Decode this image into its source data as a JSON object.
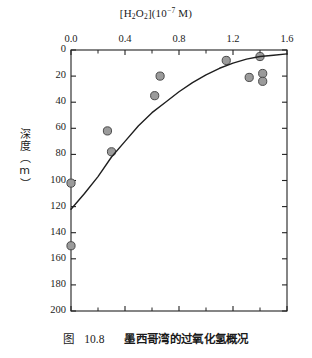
{
  "figure": {
    "caption_label": "图",
    "caption_number": "10.8",
    "caption_text": "墨西哥湾的过氧化氢概况"
  },
  "chart_data": {
    "type": "scatter",
    "title": "",
    "xlabel": "[H2O2](10-7 M)",
    "xlabel_parts": {
      "prefix": "[H",
      "sub1": "2",
      "mid": "O",
      "sub2": "2",
      "suffix": "](10",
      "exp": "−7",
      "tail": " M)"
    },
    "ylabel": "深度（m）",
    "xlim": [
      0.0,
      1.6
    ],
    "ylim": [
      0,
      200
    ],
    "y_inverted": true,
    "grid": false,
    "legend": "none",
    "x_axis_position": "top",
    "xticks": [
      0.0,
      0.4,
      0.8,
      1.2,
      1.6
    ],
    "xticklabels": [
      "0.0",
      "0.4",
      "0.8",
      "1.2",
      "1.6"
    ],
    "x_minor_ticks": [
      0.2,
      0.6,
      1.0,
      1.4
    ],
    "yticks": [
      0,
      20,
      40,
      60,
      80,
      100,
      120,
      140,
      160,
      180,
      200
    ],
    "yticklabels": [
      "0",
      "20",
      "40",
      "60",
      "80",
      "100",
      "120",
      "140",
      "160",
      "180",
      "200"
    ],
    "series": [
      {
        "name": "H2O2 profile measurements",
        "type": "scatter",
        "marker": "circle",
        "marker_color": "#9b9b9b",
        "marker_edge_color": "#4a4a4a",
        "points": [
          {
            "x": 0.0,
            "y": 102
          },
          {
            "x": 0.0,
            "y": 150
          },
          {
            "x": 0.27,
            "y": 62
          },
          {
            "x": 0.3,
            "y": 78
          },
          {
            "x": 0.62,
            "y": 35
          },
          {
            "x": 0.66,
            "y": 20
          },
          {
            "x": 1.15,
            "y": 8
          },
          {
            "x": 1.32,
            "y": 21
          },
          {
            "x": 1.4,
            "y": 5
          },
          {
            "x": 1.42,
            "y": 18
          },
          {
            "x": 1.42,
            "y": 24
          }
        ]
      },
      {
        "name": "fitted profile curve",
        "type": "line",
        "line_color": "#1f1f1f",
        "points": [
          {
            "x": 0.0,
            "y": 122
          },
          {
            "x": 0.1,
            "y": 110
          },
          {
            "x": 0.2,
            "y": 97
          },
          {
            "x": 0.3,
            "y": 82
          },
          {
            "x": 0.4,
            "y": 70
          },
          {
            "x": 0.5,
            "y": 58
          },
          {
            "x": 0.6,
            "y": 48
          },
          {
            "x": 0.7,
            "y": 40
          },
          {
            "x": 0.8,
            "y": 32
          },
          {
            "x": 0.9,
            "y": 25
          },
          {
            "x": 1.0,
            "y": 19
          },
          {
            "x": 1.1,
            "y": 14
          },
          {
            "x": 1.2,
            "y": 10
          },
          {
            "x": 1.3,
            "y": 7
          },
          {
            "x": 1.4,
            "y": 5
          },
          {
            "x": 1.5,
            "y": 4
          },
          {
            "x": 1.6,
            "y": 3
          }
        ]
      }
    ]
  }
}
